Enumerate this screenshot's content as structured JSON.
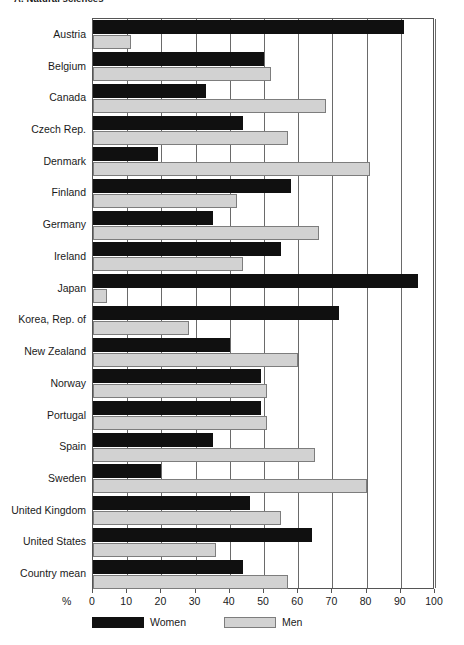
{
  "chart_data": {
    "type": "bar",
    "orientation": "horizontal",
    "title": "A. Natural sciences",
    "xlabel": "%",
    "ylabel": "",
    "xlim": [
      0,
      100
    ],
    "xticks": [
      0,
      10,
      20,
      30,
      40,
      50,
      60,
      70,
      80,
      90,
      100
    ],
    "grid": true,
    "legend_position": "bottom",
    "categories": [
      "Austria",
      "Belgium",
      "Canada",
      "Czech Rep.",
      "Denmark",
      "Finland",
      "Germany",
      "Ireland",
      "Japan",
      "Korea, Rep. of",
      "New Zealand",
      "Norway",
      "Portugal",
      "Spain",
      "Sweden",
      "United Kingdom",
      "United States",
      "Country mean"
    ],
    "series": [
      {
        "name": "Women",
        "color": "#101010",
        "values": [
          91,
          50,
          33,
          44,
          19,
          58,
          35,
          55,
          95,
          72,
          40,
          49,
          49,
          35,
          20,
          46,
          64,
          44
        ]
      },
      {
        "name": "Men",
        "color": "#d2d2d2",
        "values": [
          11,
          52,
          68,
          57,
          81,
          42,
          66,
          44,
          4,
          28,
          60,
          51,
          51,
          65,
          80,
          55,
          36,
          57
        ]
      }
    ]
  },
  "axis": {
    "unit_label": "%",
    "tick_labels": [
      "0",
      "10",
      "20",
      "30",
      "40",
      "50",
      "60",
      "70",
      "80",
      "90",
      "100"
    ]
  },
  "legend": {
    "items": [
      {
        "label": "Women",
        "swatch": "black-swatch"
      },
      {
        "label": "Men",
        "swatch": "grey-swatch"
      }
    ]
  }
}
